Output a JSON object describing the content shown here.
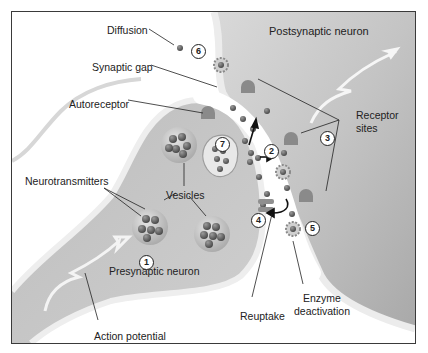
{
  "diagram": {
    "regions": {
      "postsynaptic": "Postsynaptic neuron",
      "presynaptic": "Presynaptic neuron"
    },
    "labels": {
      "diffusion": "Diffusion",
      "synaptic_gap": "Synaptic gap",
      "autoreceptor": "Autoreceptor",
      "neurotransmitters": "Neurotransmitters",
      "vesicles": "Vesicles",
      "receptor_sites_1": "Receptor",
      "receptor_sites_2": "sites",
      "reuptake": "Reuptake",
      "enzyme_1": "Enzyme",
      "enzyme_2": "deactivation",
      "action_potential": "Action potential"
    },
    "steps": [
      "1",
      "2",
      "3",
      "4",
      "5",
      "6",
      "7"
    ],
    "colors": {
      "neuron_fill": "#c9c9c9",
      "membrane": "#e4e4e4",
      "gap": "#ffffff",
      "molecule": "#6a6a6a",
      "background_post": "#bdbdbd"
    }
  }
}
